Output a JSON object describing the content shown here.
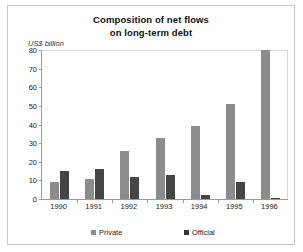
{
  "chart_data": {
    "type": "bar",
    "title": "Composition of net flows on long-term debt",
    "title_lines": [
      "Composition of net flows",
      "on long-term debt"
    ],
    "xlabel": "",
    "ylabel": "US$ billion",
    "ylim": [
      0,
      80
    ],
    "yticks": [
      0,
      10,
      20,
      30,
      40,
      50,
      60,
      70,
      80
    ],
    "ytick_labels": [
      "0",
      "10",
      "20",
      "30",
      "40",
      "50",
      "60",
      "70",
      "80"
    ],
    "grid": false,
    "legend_position": "bottom",
    "categories": [
      "1990",
      "1991",
      "1992",
      "1993",
      "1994",
      "1995",
      "1996"
    ],
    "series": [
      {
        "name": "Private",
        "color": "#8c8c8c",
        "values": [
          9,
          11,
          26,
          33,
          39,
          51,
          80
        ]
      },
      {
        "name": "Official",
        "color": "#454545",
        "values": [
          15,
          16,
          12,
          13,
          2,
          9,
          0.5
        ]
      }
    ]
  },
  "legend": {
    "items": [
      {
        "label": "Private"
      },
      {
        "label": "Official"
      }
    ]
  }
}
